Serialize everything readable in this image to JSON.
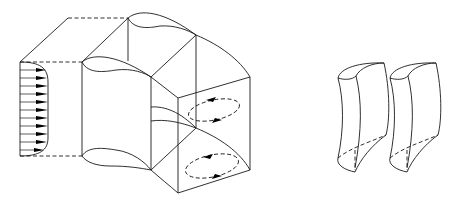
{
  "figure": {
    "colors": {
      "line": "#1a1a1a",
      "background": "#ffffff"
    },
    "parts": {
      "duct_bend": {
        "inlet_profile": {
          "arrow_count": 11,
          "type": "velocity-profile"
        },
        "outlet_vortices": {
          "count": 2,
          "style": "dashed-ellipse",
          "direction": "counter-rotating"
        }
      },
      "isolated_segments": {
        "count": 2
      }
    }
  }
}
